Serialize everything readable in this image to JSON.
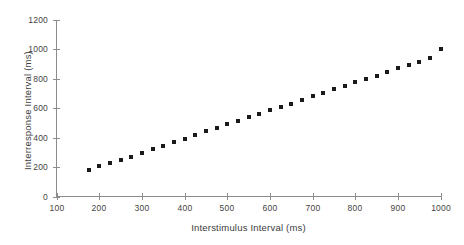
{
  "chart_data": {
    "type": "scatter",
    "title": "",
    "xlabel": "Interstimulus Interval (ms)",
    "ylabel": "Interresponse Interval (ms)",
    "xlim": [
      100,
      1000
    ],
    "ylim": [
      0,
      1200
    ],
    "xticks": [
      100,
      200,
      300,
      400,
      500,
      600,
      700,
      800,
      900,
      1000
    ],
    "yticks": [
      0,
      200,
      400,
      600,
      800,
      1000,
      1200
    ],
    "xtick_labels": [
      "100",
      "200",
      "300",
      "400",
      "500",
      "600",
      "700",
      "800",
      "900",
      "1000"
    ],
    "ytick_labels": [
      "0",
      "200",
      "400",
      "600",
      "800",
      "1000",
      "1200"
    ],
    "grid": false,
    "legend": null,
    "marker": "square",
    "marker_color": "#1a1a1a",
    "axis_color": "#8c8c8c",
    "background_color": "#ffffff",
    "x": [
      175,
      200,
      225,
      250,
      275,
      300,
      325,
      350,
      375,
      400,
      425,
      450,
      475,
      500,
      525,
      550,
      575,
      600,
      625,
      650,
      675,
      700,
      725,
      750,
      775,
      800,
      825,
      850,
      875,
      900,
      925,
      950,
      975,
      1000
    ],
    "y": [
      180,
      205,
      228,
      250,
      272,
      298,
      320,
      342,
      368,
      392,
      420,
      444,
      468,
      492,
      515,
      540,
      562,
      588,
      610,
      632,
      658,
      682,
      705,
      728,
      752,
      778,
      800,
      822,
      848,
      872,
      895,
      918,
      945,
      1000
    ]
  }
}
